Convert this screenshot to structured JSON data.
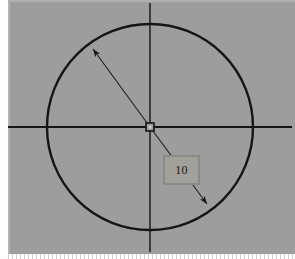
{
  "app": {
    "view_name": "cad-sketch-canvas",
    "background_color": "#9d9d9d",
    "geometry_color": "#151515"
  },
  "drawing": {
    "title": "Circle with diameter dimension",
    "entities": [
      {
        "name": "circle",
        "type": "circle",
        "center_x": 150,
        "center_y": 127,
        "radius": 103
      },
      {
        "name": "horizontal-centerline",
        "type": "line",
        "x1": 8,
        "y1": 127,
        "x2": 292,
        "y2": 127
      },
      {
        "name": "vertical-centerline",
        "type": "line",
        "x1": 150,
        "y1": 3,
        "x2": 150,
        "y2": 252
      },
      {
        "name": "center-point-marker",
        "type": "square-marker",
        "x": 150,
        "y": 127,
        "size": 7
      },
      {
        "name": "diameter-dimension-line",
        "type": "dimension",
        "x1": 91,
        "y1": 46,
        "x2": 209,
        "y2": 206,
        "arrow_start": true,
        "arrow_end": true
      }
    ]
  },
  "dimension": {
    "label": "10",
    "value": "10",
    "placeholder": "0",
    "box_fill": "#a2a09b",
    "box_border": "#8a8a86"
  },
  "ruler": {
    "name": "bottom-ruler",
    "tick_color": "#c9c9c9"
  }
}
